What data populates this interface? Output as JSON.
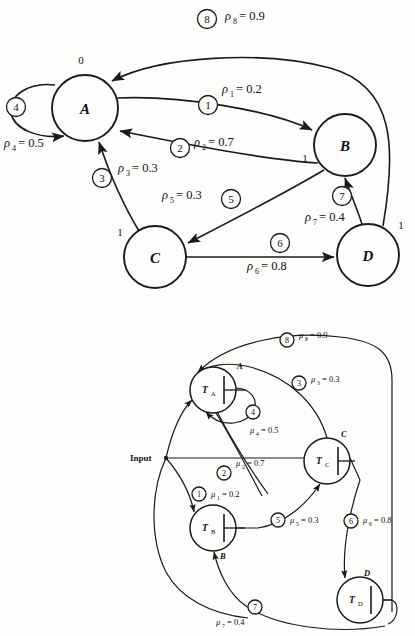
{
  "figure": {
    "parts": [
      "top-state-graph",
      "bottom-threshold-network"
    ]
  },
  "top_graph": {
    "name": "state-transition-graph",
    "nodes": [
      {
        "id": "A",
        "label": "A",
        "cx": 85,
        "cy": 108,
        "r": 33
      },
      {
        "id": "B",
        "label": "B",
        "cx": 345,
        "cy": 145,
        "r": 31
      },
      {
        "id": "C",
        "label": "C",
        "cx": 155,
        "cy": 257,
        "r": 31
      },
      {
        "id": "D",
        "label": "D",
        "cx": 368,
        "cy": 255,
        "r": 31
      }
    ],
    "port_labels": [
      {
        "text": "0",
        "x": 81,
        "y": 63
      },
      {
        "text": "1",
        "x": 305,
        "y": 158
      },
      {
        "text": "1",
        "x": 120,
        "y": 232
      },
      {
        "text": "1",
        "x": 400,
        "y": 225
      }
    ],
    "edges": [
      {
        "tag": "1",
        "weight_symbol": "ρ",
        "weight_sub": "1",
        "weight_value": "0.2",
        "weight_text": "ρ₁ = 0.2",
        "from": "A",
        "to": "B"
      },
      {
        "tag": "2",
        "weight_symbol": "ρ",
        "weight_sub": "2",
        "weight_value": "0.7",
        "weight_text": "ρ₂ = 0.7",
        "from": "B",
        "to": "A"
      },
      {
        "tag": "3",
        "weight_symbol": "ρ",
        "weight_sub": "3",
        "weight_value": "0.3",
        "weight_text": "ρ₃ = 0.3",
        "from": "C",
        "to": "A"
      },
      {
        "tag": "4",
        "weight_symbol": "ρ",
        "weight_sub": "4",
        "weight_value": "0.5",
        "weight_text": "ρ₄ = 0.5",
        "from": "A",
        "to": "A"
      },
      {
        "tag": "5",
        "weight_symbol": "ρ",
        "weight_sub": "5",
        "weight_value": "0.3",
        "weight_text": "ρ₅ = 0.3",
        "from": "B",
        "to": "C"
      },
      {
        "tag": "6",
        "weight_symbol": "ρ",
        "weight_sub": "6",
        "weight_value": "0.8",
        "weight_text": "ρ₆ = 0.8",
        "from": "C",
        "to": "D"
      },
      {
        "tag": "7",
        "weight_symbol": "ρ",
        "weight_sub": "7",
        "weight_value": "0.4",
        "weight_text": "ρ₇ = 0.4",
        "from": "D",
        "to": "B"
      },
      {
        "tag": "8",
        "weight_symbol": "ρ",
        "weight_sub": "8",
        "weight_value": "0.9",
        "weight_text": "ρ₈ = 0.9",
        "from": "D",
        "to": "A"
      }
    ],
    "labels": {
      "rho1": "ρ",
      "rho1_sub": "1",
      "rho1_eq": "= 0.2",
      "rho2": "ρ",
      "rho2_sub": "2",
      "rho2_eq": "= 0.7",
      "rho3": "ρ",
      "rho3_sub": "3",
      "rho3_eq": "= 0.3",
      "rho4": "ρ",
      "rho4_sub": "4",
      "rho4_eq": "= 0.5",
      "rho5": "ρ",
      "rho5_sub": "5",
      "rho5_eq": "= 0.3",
      "rho6": "ρ",
      "rho6_sub": "6",
      "rho6_eq": "= 0.8",
      "rho7": "ρ",
      "rho7_sub": "7",
      "rho7_eq": "= 0.4",
      "rho8": "ρ",
      "rho8_sub": "8",
      "rho8_eq": "= 0.9",
      "tag1": "1",
      "tag2": "2",
      "tag3": "3",
      "tag4": "4",
      "tag5": "5",
      "tag6": "6",
      "tag7": "7",
      "tag8": "8"
    }
  },
  "bottom_network": {
    "name": "threshold-element-network",
    "input_label": "Input",
    "gates": [
      {
        "id": "TA",
        "label": "T",
        "sub": "A",
        "out_label": "A",
        "cx": 213,
        "cy": 390,
        "r": 23
      },
      {
        "id": "TB",
        "label": "T",
        "sub": "B",
        "out_label": "B",
        "cx": 213,
        "cy": 528,
        "r": 23
      },
      {
        "id": "TC",
        "label": "T",
        "sub": "C",
        "out_label": "C",
        "cx": 327,
        "cy": 461,
        "r": 23
      },
      {
        "id": "TD",
        "label": "T",
        "sub": "D",
        "out_label": "D",
        "cx": 360,
        "cy": 600,
        "r": 23
      }
    ],
    "edges": [
      {
        "tag": "1",
        "weight_text": "μ₁ = 0.2",
        "weight_symbol": "μ",
        "weight_sub": "1",
        "weight_value": "0.2"
      },
      {
        "tag": "2",
        "weight_text": "μ₂ = 0.7",
        "weight_symbol": "μ",
        "weight_sub": "2",
        "weight_value": "0.7"
      },
      {
        "tag": "3",
        "weight_text": "μ₃ = 0.3",
        "weight_symbol": "μ",
        "weight_sub": "3",
        "weight_value": "0.3"
      },
      {
        "tag": "4",
        "weight_text": "μ₄ = 0.5",
        "weight_symbol": "μ",
        "weight_sub": "4",
        "weight_value": "0.5"
      },
      {
        "tag": "5",
        "weight_text": "μ₅ = 0.3",
        "weight_symbol": "μ",
        "weight_sub": "5",
        "weight_value": "0.3"
      },
      {
        "tag": "6",
        "weight_text": "μ₆ = 0.8",
        "weight_symbol": "μ",
        "weight_sub": "6",
        "weight_value": "0.8"
      },
      {
        "tag": "7",
        "weight_text": "μ₇ = 0.4",
        "weight_symbol": "μ",
        "weight_sub": "7",
        "weight_value": "0.4"
      },
      {
        "tag": "8",
        "weight_text": "μ₈ = 0.9",
        "weight_symbol": "μ",
        "weight_sub": "8",
        "weight_value": "0.9"
      }
    ],
    "labels": {
      "mu1": "μ",
      "mu1_sub": "1",
      "mu1_eq": "= 0.2",
      "mu2": "μ",
      "mu2_sub": "2",
      "mu2_eq": "= 0.7",
      "mu3": "μ",
      "mu3_sub": "3",
      "mu3_eq": "= 0.3",
      "mu4": "μ",
      "mu4_sub": "4",
      "mu4_eq": "= 0.5",
      "mu5": "μ",
      "mu5_sub": "5",
      "mu5_eq": "= 0.3",
      "mu6": "μ",
      "mu6_sub": "6",
      "mu6_eq": "= 0.8",
      "mu7": "μ",
      "mu7_sub": "7",
      "mu7_eq": "= 0.4",
      "mu8": "μ",
      "mu8_sub": "8",
      "mu8_eq": "= 0.9",
      "tag1": "1",
      "tag2": "2",
      "tag3": "3",
      "tag4": "4",
      "tag5": "5",
      "tag6": "6",
      "tag7": "7",
      "tag8": "8",
      "TA": "T",
      "TA_sub": "A",
      "TB": "T",
      "TB_sub": "B",
      "TC": "T",
      "TC_sub": "C",
      "TD": "T",
      "TD_sub": "D",
      "portA": "A",
      "portB": "B",
      "portC": "C",
      "portD": "D",
      "input": "Input"
    }
  }
}
